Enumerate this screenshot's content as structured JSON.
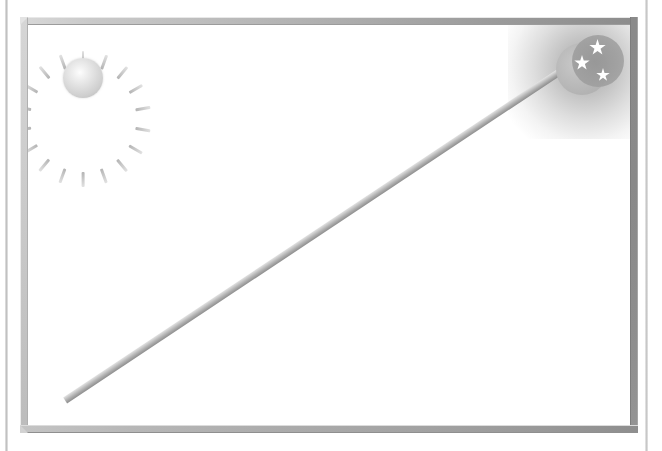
{
  "figure": {
    "width": 662,
    "height": 451,
    "background_color": "#ffffff"
  },
  "page": {
    "left_edge_name": "sheet-left-edge",
    "right_edge_name": "sheet-right-edge"
  },
  "frame": {
    "name": "outer-frame",
    "style": "beveled metallic bar",
    "thickness_px": 8,
    "colors": {
      "top_light": "#d8d8d8",
      "top_dark": "#8c8c8c",
      "left": "#cecece",
      "right": "#8a8a8a",
      "bottom_light": "#c4c4c4",
      "bottom_dark": "#8e8e8e"
    }
  },
  "divider": {
    "name": "diagonal-divider",
    "from": "bottom-left corner",
    "to": "top-right corner",
    "thickness_px": 7,
    "color_light": "#e2e2e2",
    "color_dark": "#8f8f8f"
  },
  "sun": {
    "name": "sun-icon",
    "label": "sun",
    "position": "top-left",
    "ray_count": 18,
    "body_color": "#e0e0e0",
    "highlight_color": "#fdfdfd",
    "ray_color": "#cdcdcd"
  },
  "moon": {
    "name": "crescent-moon-icon",
    "label": "crescent moon",
    "position": "top-right",
    "disc_color": "#bcbcbc",
    "glow_color": "#8c8c8c",
    "stars": [
      {
        "name": "star-1",
        "size_px": 17,
        "color": "#ffffff"
      },
      {
        "name": "star-2",
        "size_px": 16,
        "color": "#ffffff"
      },
      {
        "name": "star-3",
        "size_px": 14,
        "color": "#ffffff"
      }
    ]
  }
}
